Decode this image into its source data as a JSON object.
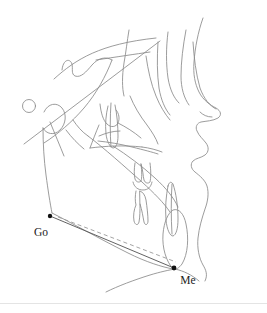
{
  "figure": {
    "background_color": "#ffffff",
    "trace_color": "#8a8a8a",
    "trace_color_dark": "#6e6e6e",
    "measure_line_color": "#5a5a5a",
    "dashed_line_color": "#9a9a9a",
    "label_color": "#1a1a1a",
    "point_color": "#111111",
    "footer_rule_color": "#e4e4e4",
    "canvas": {
      "width": 267,
      "height": 313
    }
  },
  "landmarks": [
    {
      "id": "go",
      "label": "Go",
      "name": "gonion",
      "x": 50,
      "y": 216,
      "label_x": 41,
      "label_y": 236
    },
    {
      "id": "me",
      "label": "Me",
      "name": "menton",
      "x": 174,
      "y": 268,
      "label_x": 178,
      "label_y": 284
    }
  ],
  "measurement": {
    "name": "mandibular-body-length",
    "from": "Go",
    "to": "Me",
    "solid_line": {
      "x1": 50,
      "y1": 216,
      "x2": 174,
      "y2": 268
    },
    "dashed_line": {
      "x1": 58,
      "y1": 217,
      "x2": 176,
      "y2": 262
    }
  },
  "structures": [
    {
      "id": "cranial-vault",
      "name": "cranial-vault-outline"
    },
    {
      "id": "sella",
      "name": "sella-turcica-circle",
      "cx": 29,
      "cy": 106,
      "r": 6.5
    },
    {
      "id": "anterior-cranial-base",
      "name": "anterior-cranial-base-line"
    },
    {
      "id": "orbit",
      "name": "orbital-outline"
    },
    {
      "id": "maxilla",
      "name": "maxilla-outline"
    },
    {
      "id": "palate",
      "name": "palatal-plane-line"
    },
    {
      "id": "upper-incisor",
      "name": "upper-incisor-tooth"
    },
    {
      "id": "upper-molar",
      "name": "upper-molar-tooth"
    },
    {
      "id": "lower-molar",
      "name": "lower-molar-tooth"
    },
    {
      "id": "lower-incisor",
      "name": "lower-incisor-tooth"
    },
    {
      "id": "mandible",
      "name": "mandible-outline"
    },
    {
      "id": "condyle",
      "name": "mandibular-condyle"
    },
    {
      "id": "ramus",
      "name": "mandibular-ramus"
    },
    {
      "id": "symphysis",
      "name": "mandibular-symphysis"
    },
    {
      "id": "soft-tissue-profile",
      "name": "soft-tissue-facial-profile"
    },
    {
      "id": "nose",
      "name": "nose-profile"
    },
    {
      "id": "lips",
      "name": "lip-profile"
    },
    {
      "id": "soft-tissue-chin",
      "name": "soft-tissue-chin"
    },
    {
      "id": "submental",
      "name": "submental-soft-tissue-line"
    },
    {
      "id": "pharynx",
      "name": "pharyngeal-airway-outline"
    }
  ]
}
